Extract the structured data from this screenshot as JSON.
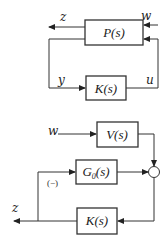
{
  "diagram_top": {
    "plant": {
      "label": "P(s)"
    },
    "controller": {
      "label": "K(s)"
    },
    "signals": {
      "z": "z",
      "w": "w",
      "y": "y",
      "u": "u"
    }
  },
  "diagram_bottom": {
    "weight": {
      "label": "V(s)"
    },
    "nominal_plant": {
      "label": "G0(s)",
      "base": "G",
      "sub": "0",
      "suffix": "(s)"
    },
    "controller": {
      "label": "K(s)"
    },
    "signals": {
      "w": "w",
      "z": "z"
    },
    "feedback_sign": "(−)"
  },
  "colors": {
    "stroke": "#333333",
    "background": "#ffffff"
  }
}
